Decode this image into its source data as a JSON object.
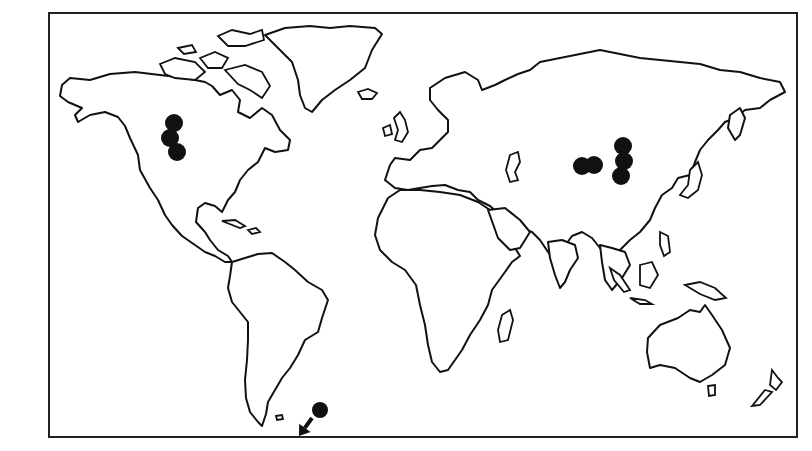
{
  "map": {
    "type": "world-outline-map",
    "frame": {
      "x": 48,
      "y": 12,
      "width": 750,
      "height": 426,
      "border_color": "#222222"
    },
    "colors": {
      "coastline": "#111111",
      "land": "#ffffff",
      "marker": "#111111"
    },
    "marker_groups": [
      {
        "region": "north-america",
        "markers": [
          {
            "x": 174,
            "y": 123,
            "r": 9
          },
          {
            "x": 170,
            "y": 138,
            "r": 9
          },
          {
            "x": 177,
            "y": 152,
            "r": 9
          }
        ]
      },
      {
        "region": "central-asia-west",
        "markers": [
          {
            "x": 582,
            "y": 166,
            "r": 9
          },
          {
            "x": 594,
            "y": 165,
            "r": 9
          }
        ]
      },
      {
        "region": "central-asia-east",
        "markers": [
          {
            "x": 623,
            "y": 146,
            "r": 9
          },
          {
            "x": 624,
            "y": 161,
            "r": 9
          },
          {
            "x": 621,
            "y": 176,
            "r": 9
          }
        ]
      },
      {
        "region": "antarctic-peninsula",
        "markers": [
          {
            "x": 320,
            "y": 410,
            "r": 8
          }
        ]
      }
    ],
    "arrow": {
      "from_x": 312,
      "from_y": 418,
      "to_x": 299,
      "to_y": 436,
      "direction": "down-left"
    }
  }
}
